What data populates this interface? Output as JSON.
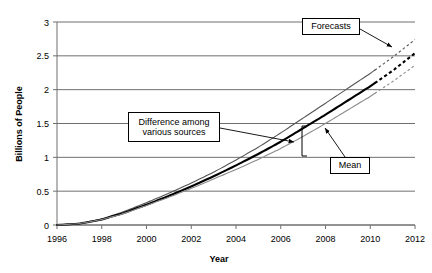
{
  "chart_data": {
    "type": "line",
    "title": "",
    "xlabel": "Year",
    "ylabel": "Billions of People",
    "xlim": [
      1996,
      2012
    ],
    "ylim": [
      0,
      3
    ],
    "xticks": [
      1996,
      1998,
      2000,
      2002,
      2004,
      2006,
      2008,
      2010,
      2012
    ],
    "yticks": [
      0,
      0.5,
      1,
      1.5,
      2,
      2.5,
      3
    ],
    "ytick_labels": [
      "0",
      "0.5",
      "1",
      "1.5",
      "2",
      "2.5",
      "3"
    ],
    "xtick_labels": [
      "1996",
      "1998",
      "2000",
      "2002",
      "2004",
      "2006",
      "2008",
      "2010",
      "2012"
    ],
    "grid": "horizontal",
    "legend": "none",
    "forecast_start_year": 2010.2,
    "series": [
      {
        "name": "Upper estimate",
        "style": "thin-solid-then-dashed",
        "color": "#555555",
        "x": [
          1996,
          1997,
          1998,
          1999,
          2000,
          2001,
          2002,
          2003,
          2004,
          2005,
          2006,
          2007,
          2008,
          2009,
          2010,
          2011,
          2012
        ],
        "values": [
          0.0,
          0.02,
          0.09,
          0.2,
          0.33,
          0.47,
          0.62,
          0.78,
          0.96,
          1.15,
          1.36,
          1.58,
          1.8,
          2.02,
          2.24,
          2.48,
          2.74
        ]
      },
      {
        "name": "Mean",
        "style": "thick-solid-then-dashed",
        "color": "#000000",
        "x": [
          1996,
          1997,
          1998,
          1999,
          2000,
          2001,
          2002,
          2003,
          2004,
          2005,
          2006,
          2007,
          2008,
          2009,
          2010,
          2011,
          2012
        ],
        "values": [
          0.0,
          0.02,
          0.08,
          0.18,
          0.3,
          0.43,
          0.57,
          0.72,
          0.88,
          1.05,
          1.23,
          1.43,
          1.63,
          1.84,
          2.05,
          2.28,
          2.54
        ]
      },
      {
        "name": "Lower estimate",
        "style": "thin-solid-then-dashed",
        "color": "#8a8a8a",
        "x": [
          1996,
          1997,
          1998,
          1999,
          2000,
          2001,
          2002,
          2003,
          2004,
          2005,
          2006,
          2007,
          2008,
          2009,
          2010,
          2011,
          2012
        ],
        "values": [
          0.0,
          0.02,
          0.08,
          0.17,
          0.29,
          0.41,
          0.54,
          0.68,
          0.82,
          0.97,
          1.13,
          1.31,
          1.5,
          1.7,
          1.9,
          2.12,
          2.36
        ]
      }
    ],
    "annotations": [
      {
        "name": "forecasts",
        "label": "Forecasts",
        "box": {
          "x": 302,
          "y": 18,
          "w": 58,
          "h": 17
        },
        "arrow": {
          "from_x": 360,
          "from_y": 29,
          "to_x": 392,
          "to_y": 47
        }
      },
      {
        "name": "difference-among-various-sources",
        "label": "Difference among\nvarious sources",
        "line1": "Difference among",
        "line2": "various sources",
        "box": {
          "x": 128,
          "y": 112,
          "w": 92,
          "h": 30
        },
        "arrow": {
          "from_x": 220,
          "from_y": 128,
          "to_x": 294,
          "to_y": 142
        }
      },
      {
        "name": "mean",
        "label": "Mean",
        "box": {
          "x": 330,
          "y": 157,
          "w": 40,
          "h": 17
        },
        "arrow": {
          "from_x": 345,
          "from_y": 157,
          "to_x": 325,
          "to_y": 128
        }
      }
    ],
    "bracket": {
      "name": "difference-bracket",
      "x": 302,
      "y_top": 126,
      "y_bottom": 156
    }
  },
  "plot_geometry": {
    "left": 57,
    "right": 415,
    "top": 22,
    "bottom": 225
  }
}
